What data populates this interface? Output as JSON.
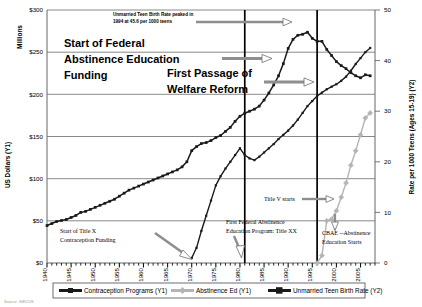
{
  "chart_data": {
    "type": "line",
    "title": "",
    "xlabel": "",
    "ylabel": "US Dollars (Y1)",
    "y_unit_label": "Millions",
    "y2label": "Rate per 1000 Teens (Ages 15-19) (Y2)",
    "xlim": [
      1940,
      2008
    ],
    "ylim": [
      0,
      300
    ],
    "y2lim": [
      0,
      50
    ],
    "grid": true,
    "legend_position": "bottom",
    "x_ticks": [
      "1940",
      "1945",
      "1950",
      "1955",
      "1960",
      "1965",
      "1970",
      "1975",
      "1980",
      "1985",
      "1990",
      "1995",
      "2000",
      "2005"
    ],
    "y_ticks": [
      "$0",
      "$50",
      "$100",
      "$150",
      "$200",
      "$250",
      "$300"
    ],
    "y2_ticks": [
      "0",
      "10",
      "20",
      "30",
      "40",
      "50"
    ],
    "series": [
      {
        "name": "Contraception Programs (Y1)",
        "axis": "Y1",
        "color": "#1a1a1a",
        "marker": "square",
        "x": [
          1970,
          1971,
          1972,
          1973,
          1974,
          1975,
          1976,
          1977,
          1978,
          1979,
          1980,
          1981,
          1982,
          1983,
          1984,
          1985,
          1986,
          1987,
          1988,
          1989,
          1990,
          1991,
          1992,
          1993,
          1994,
          1995,
          1996,
          1997,
          1998,
          1999,
          2000,
          2001,
          2002,
          2003,
          2004,
          2005,
          2006,
          2007
        ],
        "values": [
          6,
          18,
          38,
          56,
          74,
          92,
          103,
          112,
          120,
          128,
          136,
          128,
          124,
          122,
          126,
          131,
          136,
          141,
          147,
          152,
          157,
          163,
          170,
          178,
          186,
          192,
          198,
          202,
          206,
          209,
          212,
          216,
          221,
          228,
          236,
          243,
          250,
          255
        ]
      },
      {
        "name": "Abstinence Ed (Y1)",
        "axis": "Y1",
        "color": "#b4b4b4",
        "marker": "diamond",
        "x": [
          1996,
          1997,
          1998,
          1999,
          2000,
          2001,
          2002,
          2003,
          2004,
          2005,
          2006,
          2007
        ],
        "values": [
          0,
          9,
          50,
          52,
          62,
          78,
          95,
          116,
          133,
          152,
          172,
          178
        ]
      },
      {
        "name": "Unmarried Teen Birth Rate (Y2)",
        "axis": "Y2",
        "color": "#1a1a1a",
        "marker": "square",
        "x": [
          1940,
          1941,
          1942,
          1943,
          1944,
          1945,
          1946,
          1947,
          1948,
          1949,
          1950,
          1951,
          1952,
          1953,
          1954,
          1955,
          1956,
          1957,
          1958,
          1959,
          1960,
          1961,
          1962,
          1963,
          1964,
          1965,
          1966,
          1967,
          1968,
          1969,
          1970,
          1971,
          1972,
          1973,
          1974,
          1975,
          1976,
          1977,
          1978,
          1979,
          1980,
          1981,
          1982,
          1983,
          1984,
          1985,
          1986,
          1987,
          1988,
          1989,
          1990,
          1991,
          1992,
          1993,
          1994,
          1995,
          1996,
          1997,
          1998,
          1999,
          2000,
          2001,
          2002,
          2003,
          2004,
          2005,
          2006,
          2007
        ],
        "values": [
          7.4,
          7.8,
          8.2,
          8.4,
          8.6,
          9.0,
          9.4,
          10.0,
          10.2,
          10.6,
          11.0,
          11.4,
          11.8,
          12.2,
          12.6,
          13.2,
          13.8,
          14.4,
          14.8,
          15.2,
          15.6,
          16.0,
          16.4,
          16.8,
          17.2,
          17.6,
          18.0,
          18.4,
          19.0,
          20.0,
          22.2,
          23.0,
          23.6,
          23.8,
          24.2,
          24.8,
          25.2,
          26.0,
          26.8,
          28.0,
          29.0,
          29.6,
          30.0,
          30.4,
          31.0,
          32.2,
          33.6,
          35.2,
          37.0,
          39.4,
          42.4,
          44.2,
          45.0,
          45.2,
          45.6,
          44.4,
          43.8,
          43.8,
          42.2,
          41.0,
          39.8,
          39.0,
          38.4,
          37.6,
          37.0,
          36.6,
          37.2,
          37.0
        ]
      }
    ],
    "vertical_lines": [
      {
        "year": 1981,
        "label": "first-federal-abstinence-line"
      },
      {
        "year": 1996,
        "label": "welfare-reform-line"
      }
    ],
    "annotations": [
      {
        "id": "peak-note",
        "text_line1": "Unmarried Teen Birth Rate peaked in",
        "text_line2": "1994 at 45.6 per 1000 teens"
      },
      {
        "id": "start-federal-abstinence",
        "text_line1": "Start of Federal",
        "text_line2": "Abstinence Education",
        "text_line3": "Funding"
      },
      {
        "id": "welfare-reform",
        "text_line1": "First Passage of",
        "text_line2": "Welfare Reform"
      },
      {
        "id": "title-x",
        "text_line1": "Start of Title X",
        "text_line2": "Contraception Funding"
      },
      {
        "id": "title-xx",
        "text_line1": "First Federal Abstinence",
        "text_line2": "Education Program:  Title XX"
      },
      {
        "id": "title-v",
        "text_line1": "Title V starts"
      },
      {
        "id": "cbae",
        "text_line1": "CBAE --Abstinence",
        "text_line2": "Education Starts"
      }
    ],
    "footer": "Source: SIECUS"
  }
}
